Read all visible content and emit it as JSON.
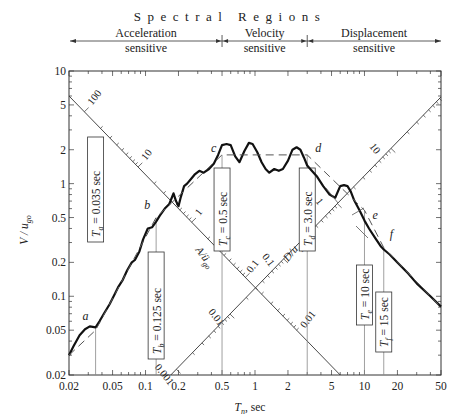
{
  "chart_data": {
    "type": "line",
    "title": "Spectral Regions",
    "regions": [
      {
        "name": "Acceleration sensitive",
        "line1": "Acceleration",
        "line2": "sensitive",
        "from": 0.02,
        "to": 0.5
      },
      {
        "name": "Velocity sensitive",
        "line1": "Velocity",
        "line2": "sensitive",
        "from": 0.5,
        "to": 3.0
      },
      {
        "name": "Displacement sensitive",
        "line1": "Displacement",
        "line2": "sensitive",
        "from": 3.0,
        "to": 50
      }
    ],
    "xlabel_main": "T",
    "xlabel_sub": "n",
    "xlabel_unit": ", sec",
    "ylabel_main": "V / u",
    "ylabel_sub": "go",
    "xscale": "log",
    "yscale": "log",
    "xlim": [
      0.02,
      50
    ],
    "ylim": [
      0.02,
      10
    ],
    "xticks": [
      0.02,
      0.05,
      0.1,
      0.2,
      0.5,
      1,
      2,
      5,
      10,
      20,
      50
    ],
    "xtick_labels": [
      "0.02",
      "0.05",
      "0.1",
      "0.2",
      "0.5",
      "1",
      "2",
      "5",
      "10",
      "20",
      "50"
    ],
    "yticks": [
      0.02,
      0.05,
      0.1,
      0.2,
      0.5,
      1,
      2,
      5,
      10
    ],
    "ytick_labels": [
      "0.02",
      "0.05",
      "0.1",
      "0.2",
      "0.5",
      "1",
      "2",
      "5",
      "10"
    ],
    "grid": false,
    "series": [
      {
        "name": "Response spectrum (jagged)",
        "style": "solid-thick",
        "x": [
          0.02,
          0.022,
          0.025,
          0.028,
          0.031,
          0.035,
          0.038,
          0.042,
          0.047,
          0.052,
          0.056,
          0.062,
          0.068,
          0.075,
          0.08,
          0.088,
          0.095,
          0.105,
          0.115,
          0.125,
          0.135,
          0.15,
          0.165,
          0.18,
          0.19,
          0.2,
          0.21,
          0.225,
          0.24,
          0.26,
          0.28,
          0.31,
          0.34,
          0.38,
          0.42,
          0.46,
          0.5,
          0.55,
          0.6,
          0.66,
          0.72,
          0.8,
          0.88,
          0.95,
          1.05,
          1.15,
          1.25,
          1.35,
          1.5,
          1.65,
          1.8,
          2.0,
          2.2,
          2.4,
          2.6,
          2.8,
          3.0,
          3.3,
          3.7,
          4.2,
          4.8,
          5.4,
          6.0,
          6.5,
          7.0,
          7.5,
          8.0,
          9.0,
          10,
          11,
          12.5,
          14,
          15,
          17,
          20,
          25,
          30,
          40,
          50
        ],
        "y": [
          0.03,
          0.036,
          0.045,
          0.051,
          0.054,
          0.053,
          0.06,
          0.071,
          0.085,
          0.103,
          0.12,
          0.14,
          0.17,
          0.2,
          0.21,
          0.25,
          0.32,
          0.4,
          0.41,
          0.46,
          0.52,
          0.6,
          0.66,
          0.82,
          0.7,
          0.63,
          0.76,
          0.95,
          1.0,
          1.1,
          1.2,
          1.3,
          1.25,
          1.35,
          1.5,
          1.8,
          2.2,
          2.25,
          2.2,
          1.75,
          1.55,
          1.95,
          2.3,
          2.25,
          1.9,
          1.55,
          1.35,
          1.25,
          1.35,
          1.3,
          1.35,
          1.6,
          2.0,
          2.1,
          2.0,
          1.7,
          1.45,
          1.3,
          1.15,
          0.95,
          0.8,
          0.75,
          0.95,
          0.97,
          0.95,
          0.85,
          0.72,
          0.58,
          0.47,
          0.4,
          0.33,
          0.28,
          0.26,
          0.235,
          0.2,
          0.16,
          0.13,
          0.1,
          0.081
        ]
      },
      {
        "name": "Idealized spectrum (dashed)",
        "style": "dashed",
        "x": [
          0.02,
          0.035,
          0.125,
          0.5,
          3.0,
          10,
          15,
          50
        ],
        "y": [
          0.03,
          0.05,
          0.5,
          1.8,
          1.8,
          0.58,
          0.27,
          0.08
        ]
      }
    ],
    "period_markers": [
      {
        "key": "a",
        "T": 0.035,
        "label_main": "T",
        "label_sub": "a",
        "label_rest": " = 0.035 sec",
        "point_V": 0.052
      },
      {
        "key": "b",
        "T": 0.125,
        "label_main": "T",
        "label_sub": "b",
        "label_rest": " = 0.125 sec",
        "point_V": 0.5
      },
      {
        "key": "c",
        "T": 0.5,
        "label_main": "T",
        "label_sub": "c",
        "label_rest": " = 0.5 sec",
        "point_V": 1.8
      },
      {
        "key": "d",
        "T": 3.0,
        "label_main": "T",
        "label_sub": "d",
        "label_rest": " = 3.0 sec",
        "point_V": 1.8
      },
      {
        "key": "e",
        "T": 10,
        "label_main": "T",
        "label_sub": "e",
        "label_rest": " = 10 sec",
        "point_V": 0.58
      },
      {
        "key": "f",
        "T": 15,
        "label_main": "T",
        "label_sub": "f",
        "label_rest": " = 15 sec",
        "point_V": 0.27
      }
    ],
    "diagonal_axes": [
      {
        "name": "A/ug0 (pseudo-acceleration)",
        "label": "A/ü",
        "label_sub": "go",
        "direction": "descending",
        "ticks": [
          100,
          10,
          1,
          0.1,
          0.01,
          0.001
        ],
        "tick_labels": [
          "100",
          "10",
          "1",
          "0.1",
          "0.01",
          "0.001"
        ]
      },
      {
        "name": "D/ug0 (deformation)",
        "label": "D/u",
        "label_sub": "go",
        "direction": "ascending",
        "ticks": [
          0.001,
          0.01,
          0.1,
          1,
          10
        ],
        "tick_labels": [
          "0.001",
          "0.01",
          "0.1",
          "1",
          "10"
        ]
      }
    ],
    "point_labels": [
      "a",
      "b",
      "c",
      "d",
      "e",
      "f"
    ]
  },
  "colors": {
    "spectrum": "#111111",
    "axis": "#333333",
    "guide": "#555555",
    "vertical_marker": "#888888",
    "text": "#222222"
  }
}
